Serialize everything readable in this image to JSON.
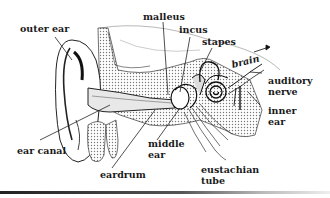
{
  "diagram": {
    "labels": {
      "outer_ear": "outer ear",
      "malleus": "malleus",
      "incus": "incus",
      "stapes": "stapes",
      "brain": "brain",
      "auditory_nerve_1": "auditory",
      "auditory_nerve_2": "nerve",
      "inner_ear_1": "inner",
      "inner_ear_2": "ear",
      "ear_canal": "ear canal",
      "middle_ear_1": "middle",
      "middle_ear_2": "ear",
      "eardrum": "eardrum",
      "eustachian_tube_1": "eustachian",
      "eustachian_tube_2": "tube"
    },
    "colors": {
      "ink": "#1a1a1a",
      "background": "#ffffff",
      "stipple": "#bdbdbd"
    }
  }
}
